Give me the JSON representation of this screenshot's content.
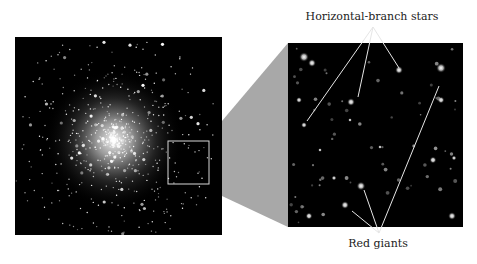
{
  "figure": {
    "labels": {
      "horizontal_branch": "Horizontal-branch stars",
      "red_giants": "Red giants"
    },
    "panels": {
      "left": {
        "description": "Globular cluster star field"
      },
      "right": {
        "description": "Magnified region of cluster outskirts"
      }
    },
    "colors": {
      "background": "#ffffff",
      "sky": "#000000",
      "connector": "#a8a8a8",
      "zoom_box": "#d8d8d8",
      "pointer_lines": "#e6e6e6"
    }
  }
}
